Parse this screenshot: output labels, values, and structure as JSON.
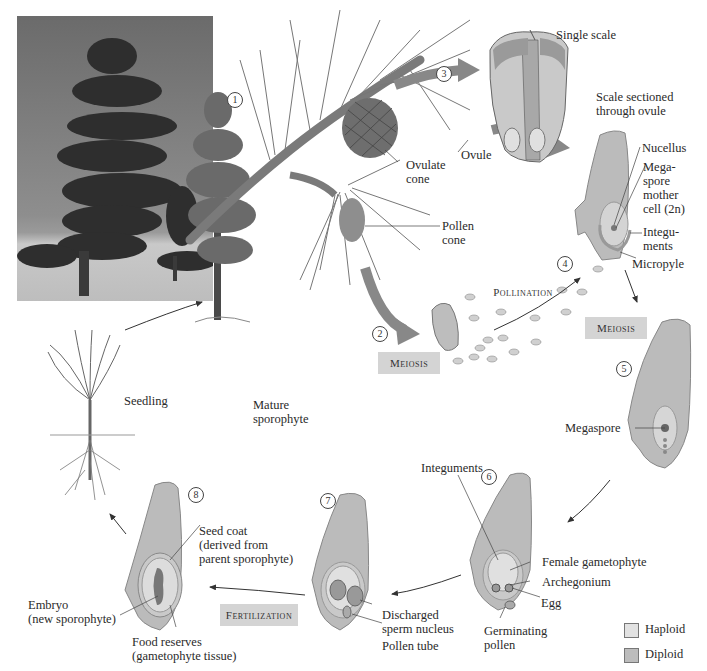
{
  "colors": {
    "haploid": "#dedede",
    "diploid": "#bdbdbd",
    "tissue": "#b8b8b8",
    "process_box": "#d4d4d4",
    "arrow": "#8a8a8a"
  },
  "photo": {
    "alt": "Photograph of mature pine tree in a field"
  },
  "steps": [
    {
      "num": "1",
      "label": "Mature sporophyte"
    },
    {
      "num": "2",
      "process": "Meiosis"
    },
    {
      "num": "3"
    },
    {
      "num": "4",
      "process": "Pollination"
    },
    {
      "num": "5",
      "process": "Meiosis"
    },
    {
      "num": "6"
    },
    {
      "num": "7",
      "process": "Fertilization"
    },
    {
      "num": "8"
    }
  ],
  "labels": {
    "single_scale": "Single scale",
    "ovule": "Ovule",
    "ovulate_cone": "Ovulate\ncone",
    "pollen_cone": "Pollen\ncone",
    "scale_sectioned": "Scale sectioned\nthrough ovule",
    "nucellus": "Nucellus",
    "megaspore_mother_cell": "Mega-\nspore\nmother\ncell (2n)",
    "integuments_top": "Integu-\nments",
    "micropyle": "Micropyle",
    "pollination": "Pollination",
    "meiosis_left": "Meiosis",
    "meiosis_right": "Meiosis",
    "megaspore": "Megaspore",
    "seedling": "Seedling",
    "mature_sporophyte": "Mature\nsporophyte",
    "integuments_6": "Integuments",
    "female_gametophyte": "Female gametophyte",
    "archegonium": "Archegonium",
    "egg": "Egg",
    "germinating_pollen": "Germinating\npollen",
    "discharged_sperm": "Discharged\nsperm nucleus",
    "pollen_tube": "Pollen tube",
    "fertilization": "Fertilization",
    "seed_coat": "Seed coat\n(derived from\nparent sporophyte)",
    "embryo": "Embryo\n(new sporophyte)",
    "food_reserves": "Food reserves\n(gametophyte tissue)"
  },
  "legend": [
    {
      "label": "Haploid",
      "color": "#e2e2e2"
    },
    {
      "label": "Diploid",
      "color": "#bcbcbc"
    }
  ]
}
